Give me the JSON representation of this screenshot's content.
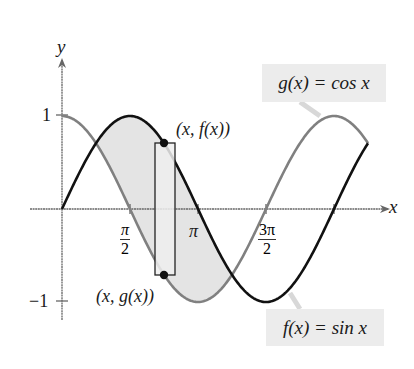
{
  "axes": {
    "x_label": "x",
    "y_label": "y",
    "y_ticks": [
      {
        "value": 1,
        "label": "1"
      },
      {
        "value": -1,
        "label": "−1"
      }
    ],
    "x_ticks": [
      {
        "value": "pi/2",
        "num": "π",
        "den": "2"
      },
      {
        "value": "pi",
        "label": "π"
      },
      {
        "value": "3pi/2",
        "num": "3π",
        "den": "2"
      },
      {
        "value": "2pi",
        "label": ""
      }
    ]
  },
  "labels": {
    "g_eq": "g(x) = cos x",
    "f_eq": "f(x) = sin x",
    "point_f": "(x, f(x))",
    "point_g": "(x, g(x))"
  },
  "colors": {
    "sin_curve": "#111111",
    "cos_curve": "#808080",
    "shade": "#e4e4e4",
    "label_box": "#ececec",
    "axis": "#666666"
  },
  "chart_data": {
    "type": "line",
    "title": "",
    "xlabel": "x",
    "ylabel": "y",
    "xlim": [
      0,
      7.07
    ],
    "ylim": [
      -1.2,
      1.55
    ],
    "x_tick_labels": [
      "π/2",
      "π",
      "3π/2"
    ],
    "y_tick_labels": [
      "1",
      "−1"
    ],
    "series": [
      {
        "name": "f(x) = sin x",
        "function": "sin x",
        "domain": [
          0,
          7.07
        ]
      },
      {
        "name": "g(x) = cos x",
        "function": "cos x",
        "domain": [
          0,
          7.07
        ]
      }
    ],
    "shaded_region": {
      "between": [
        "f",
        "g"
      ],
      "from": "π/4",
      "to": "5π/4"
    },
    "representative_rectangle": {
      "x": "3π/4",
      "top": "(x, f(x))",
      "bottom": "(x, g(x))"
    },
    "annotations": [
      "(x, f(x))",
      "(x, g(x))",
      "g(x) = cos x",
      "f(x) = sin x"
    ],
    "grid": false,
    "legend": "callout labels"
  }
}
